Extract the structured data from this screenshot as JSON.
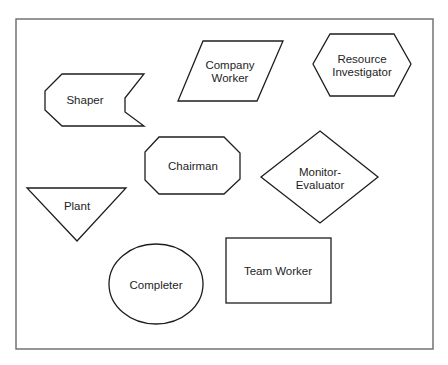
{
  "diagram": {
    "shapes": [
      {
        "id": "shaper",
        "kind": "notched-pentagon",
        "lines": [
          "Shaper"
        ]
      },
      {
        "id": "company-worker",
        "kind": "parallelogram",
        "lines": [
          "Company",
          "Worker"
        ]
      },
      {
        "id": "resource-investigator",
        "kind": "hexagon",
        "lines": [
          "Resource",
          "Investigator"
        ]
      },
      {
        "id": "chairman",
        "kind": "octagon",
        "lines": [
          "Chairman"
        ]
      },
      {
        "id": "monitor-evaluator",
        "kind": "diamond",
        "lines": [
          "Monitor-",
          "Evaluator"
        ]
      },
      {
        "id": "plant",
        "kind": "inverted-triangle",
        "lines": [
          "Plant"
        ]
      },
      {
        "id": "completer",
        "kind": "ellipse",
        "lines": [
          "Completer"
        ]
      },
      {
        "id": "team-worker",
        "kind": "rectangle",
        "lines": [
          "Team Worker"
        ]
      }
    ]
  }
}
